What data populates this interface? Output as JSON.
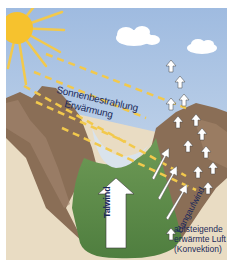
{
  "diagram": {
    "title": "",
    "labels": {
      "sonnenbestrahlung": "Sonnenbestrahlung",
      "erwaermung": "Erwärmung",
      "talwind": "Talwind",
      "hangaufwind": "Hangaufwind"
    },
    "legend": {
      "line1": "aufsteigende",
      "line2": "erwärmte Luft",
      "line3": "(Konvektion)",
      "icon": "up-arrow-icon"
    },
    "colors": {
      "sky": "#a8c2e3",
      "sun": "#f6c22e",
      "rays": "#f2c94c",
      "mountain": "#8a6e56",
      "mountain_light": "#a88a6c",
      "ground": "#e9dcc3",
      "valley": "#5f8f4c",
      "text": "#1c2a5a"
    }
  }
}
